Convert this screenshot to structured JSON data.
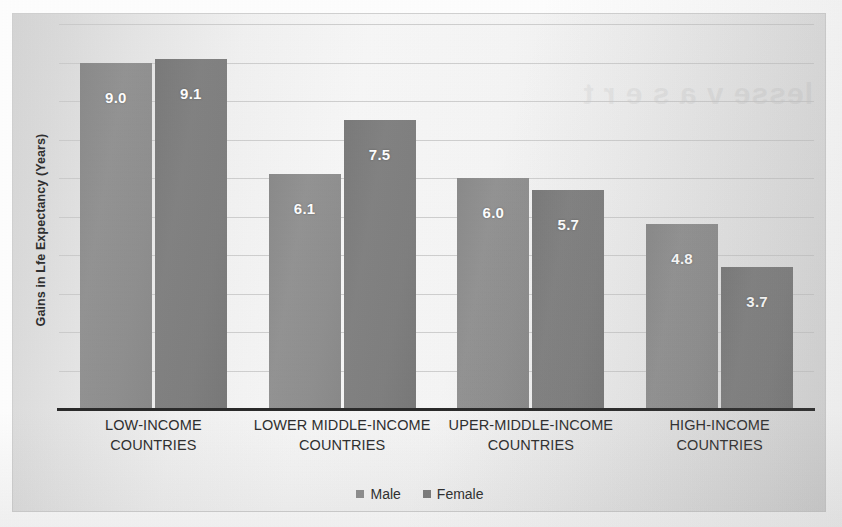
{
  "chart_data": {
    "type": "bar",
    "title": "",
    "subtitle": "",
    "xlabel": "",
    "ylabel": "Gains in Lfe Expectancy (Years)",
    "categories": [
      "LOW-INCOME COUNTRIES",
      "LOWER MIDDLE-INCOME COUNTRIES",
      "UPER-MIDDLE-INCOME COUNTRIES",
      "HIGH-INCOME COUNTRIES"
    ],
    "series": [
      {
        "name": "Male",
        "color": "#8f8f8f",
        "values": [
          9.0,
          6.1,
          6.0,
          4.8
        ],
        "labels": [
          "9.0",
          "6.1",
          "6.0",
          "4.8"
        ]
      },
      {
        "name": "Female",
        "color": "#7d7d7d",
        "values": [
          9.1,
          7.5,
          5.7,
          3.7
        ],
        "labels": [
          "9.1",
          "7.5",
          "5.7",
          "3.7"
        ]
      }
    ],
    "ylim": [
      0,
      10.0
    ],
    "gridlines": [
      1.0,
      2.0,
      3.0,
      4.0,
      5.0,
      6.0,
      7.0,
      8.0,
      9.0,
      10.0
    ],
    "grid": true,
    "y_tick_labels_visible": false,
    "legend": {
      "position": "bottom",
      "entries": [
        "Male",
        "Female"
      ]
    },
    "data_labels_visible": true
  },
  "figure": {
    "bleed_through_text": "lesse v a s e r t",
    "plot_background": "#f2f2f2",
    "frame_border_color": "#d2d2d2",
    "axis_line_color": "#2b2b2b",
    "gridline_color": "#c9c9c9",
    "data_label_color": "#ffffff"
  }
}
